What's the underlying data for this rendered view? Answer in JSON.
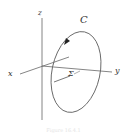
{
  "diagram": {
    "axes": {
      "x_label": "x",
      "y_label": "y",
      "z_label": "z"
    },
    "curve": {
      "label": "C",
      "orientation": "counterclockwise-arrow"
    },
    "surface_label": "Σ",
    "caption": "Figure 16.4.1",
    "colors": {
      "stroke": "#555555",
      "background": "#ffffff"
    }
  }
}
